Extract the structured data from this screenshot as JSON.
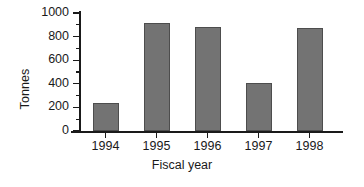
{
  "chart_data": {
    "type": "bar",
    "title": "",
    "subtitle": "",
    "xlabel": "Fiscal year",
    "ylabel": "Tonnes",
    "categories": [
      "1994",
      "1995",
      "1996",
      "1997",
      "1998"
    ],
    "values": [
      240,
      915,
      880,
      405,
      870
    ],
    "series": [
      {
        "name": "Tonnes",
        "values": [
          240,
          915,
          880,
          405,
          870
        ]
      }
    ],
    "ylim": [
      0,
      1000
    ],
    "y_ticks": [
      0,
      200,
      400,
      600,
      800,
      1000
    ],
    "y_tick_labels": [
      "0",
      "200",
      "400",
      "600",
      "800",
      "1000"
    ],
    "y_minor_ticks": [
      100,
      300,
      500,
      700,
      900
    ],
    "grid": false,
    "legend": false,
    "legend_position": "none",
    "bar_color": "#737373",
    "bar_edge_color": "#4d4d4d",
    "axis_color": "#1a1a1a",
    "background_color": "#ffffff",
    "annotations": []
  }
}
